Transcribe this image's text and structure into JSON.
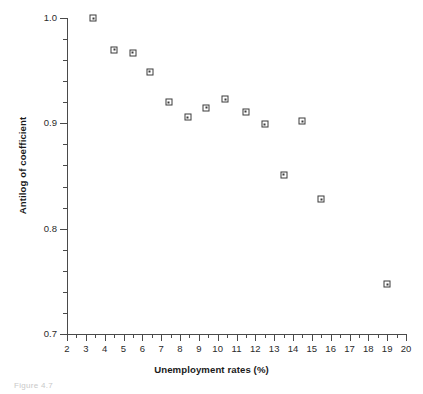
{
  "figure": {
    "background_color": "#ffffff",
    "axis_color": "#4a4a4a",
    "marker_color": "#3b3b3b",
    "caption": "Figure 4.7"
  },
  "chart_data": {
    "type": "scatter",
    "title": "",
    "xlabel": "Unemployment rates (%)",
    "ylabel": "Antilog of coefficient",
    "xlim": [
      2,
      20
    ],
    "ylim": [
      0.7,
      1.0
    ],
    "grid": false,
    "legend": null,
    "x_major_ticks": [
      2,
      3,
      4,
      5,
      6,
      7,
      8,
      9,
      10,
      11,
      12,
      13,
      14,
      15,
      16,
      17,
      18,
      19,
      20
    ],
    "x_tick_labels": [
      "2",
      "3",
      "4",
      "5",
      "6",
      "7",
      "8",
      "9",
      "10",
      "11",
      "12",
      "13",
      "14",
      "15",
      "16",
      "17",
      "18",
      "19",
      "20"
    ],
    "x_minor_interval": 0.5,
    "y_major_ticks": [
      0.7,
      0.8,
      0.9,
      1.0
    ],
    "y_tick_labels": [
      "0.7",
      "0.8",
      "0.9",
      "1.0"
    ],
    "y_minor_interval": 0.02,
    "marker_style": "open-square",
    "points": [
      {
        "x": 3.4,
        "y": 1.0
      },
      {
        "x": 4.5,
        "y": 0.97
      },
      {
        "x": 5.5,
        "y": 0.967
      },
      {
        "x": 6.4,
        "y": 0.949
      },
      {
        "x": 7.4,
        "y": 0.92
      },
      {
        "x": 8.4,
        "y": 0.906
      },
      {
        "x": 9.4,
        "y": 0.915
      },
      {
        "x": 10.4,
        "y": 0.923
      },
      {
        "x": 11.5,
        "y": 0.911
      },
      {
        "x": 12.5,
        "y": 0.899
      },
      {
        "x": 13.5,
        "y": 0.851
      },
      {
        "x": 14.5,
        "y": 0.902
      },
      {
        "x": 15.5,
        "y": 0.828
      },
      {
        "x": 19.0,
        "y": 0.747
      }
    ]
  }
}
